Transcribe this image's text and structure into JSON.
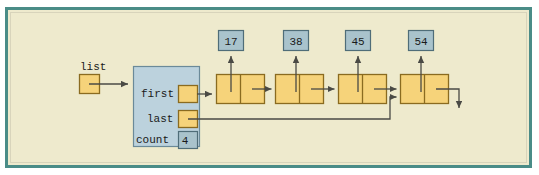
{
  "figure": {
    "frame": {
      "border_color": "#4a8c87",
      "background_color": "#eeeacd",
      "outer_background": "#ffffff"
    },
    "colors": {
      "node_fill": "#f6d37a",
      "node_stroke": "#8a6b20",
      "object_fill": "#bcd2dd",
      "object_stroke": "#6b8a99",
      "data_box_fill": "#a9c3cc",
      "data_box_stroke": "#4f6d78",
      "arrow_color": "#4a4a45",
      "text_color": "#1a1a1a"
    },
    "external_pointer": {
      "label": "list",
      "name": "list-variable-pointer"
    },
    "list_object": {
      "fields": [
        {
          "label": "first",
          "kind": "pointer",
          "value": ""
        },
        {
          "label": "last",
          "kind": "pointer",
          "value": ""
        },
        {
          "label": "count",
          "kind": "integer",
          "value": "4"
        }
      ]
    },
    "nodes": [
      {
        "index": 1,
        "data_value": "17",
        "next": "node-2"
      },
      {
        "index": 2,
        "data_value": "38",
        "next": "node-3"
      },
      {
        "index": 3,
        "data_value": "45",
        "next": "node-4"
      },
      {
        "index": 4,
        "data_value": "54",
        "next": "null"
      }
    ],
    "edges": [
      {
        "name": "list-to-object",
        "from": "list-variable-pointer",
        "to": "list-object"
      },
      {
        "name": "first-to-node-1",
        "from": "first-field",
        "to": "node-1"
      },
      {
        "name": "last-to-node-4",
        "from": "last-field",
        "to": "node-4"
      },
      {
        "name": "node-1-to-node-2",
        "from": "node-1-next",
        "to": "node-2"
      },
      {
        "name": "node-2-to-node-3",
        "from": "node-2-next",
        "to": "node-3"
      },
      {
        "name": "node-3-to-node-4",
        "from": "node-3-next",
        "to": "node-4"
      },
      {
        "name": "node-4-to-null",
        "from": "node-4-next",
        "to": "null-terminator"
      },
      {
        "name": "node-1-data-link",
        "from": "node-1-data",
        "to": "data-box-17"
      },
      {
        "name": "node-2-data-link",
        "from": "node-2-data",
        "to": "data-box-38"
      },
      {
        "name": "node-3-data-link",
        "from": "node-3-data",
        "to": "data-box-45"
      },
      {
        "name": "node-4-data-link",
        "from": "node-4-data",
        "to": "data-box-54"
      }
    ]
  }
}
